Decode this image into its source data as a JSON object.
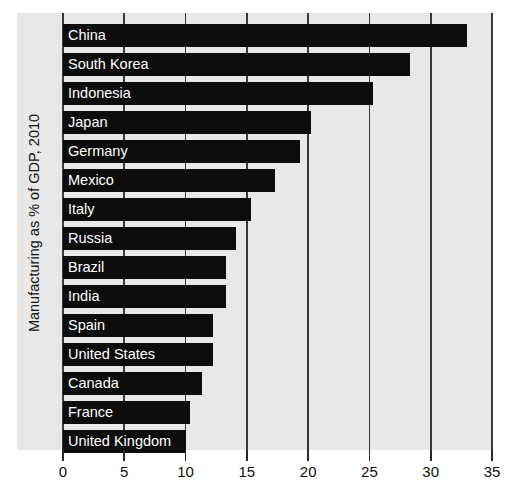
{
  "chart_data": {
    "type": "bar",
    "orientation": "horizontal",
    "title": "",
    "xlabel": "",
    "ylabel": "Manufacturing as % of GDP, 2010",
    "xlim": [
      0,
      35
    ],
    "xticks": [
      0,
      5,
      10,
      15,
      20,
      25,
      30,
      35
    ],
    "xtick_labels": [
      "0",
      "5",
      "10",
      "15",
      "20",
      "25",
      "30",
      "35"
    ],
    "grid": true,
    "legend": null,
    "categories": [
      "China",
      "South Korea",
      "Indonesia",
      "Japan",
      "Germany",
      "Mexico",
      "Italy",
      "Russia",
      "Brazil",
      "India",
      "Spain",
      "United States",
      "Canada",
      "France",
      "United Kingdom"
    ],
    "values": [
      33.0,
      28.3,
      25.3,
      20.2,
      19.3,
      17.3,
      15.3,
      14.1,
      13.3,
      13.3,
      12.2,
      12.2,
      11.3,
      10.4,
      10.0
    ],
    "colors": {
      "bar": "#0d0d0d",
      "plot_background": "#e8e8e8",
      "figure_background": "#ffffff",
      "grid": "#3a3a3a",
      "bar_label_text": "#ffffff",
      "axis_text": "#101010"
    }
  }
}
